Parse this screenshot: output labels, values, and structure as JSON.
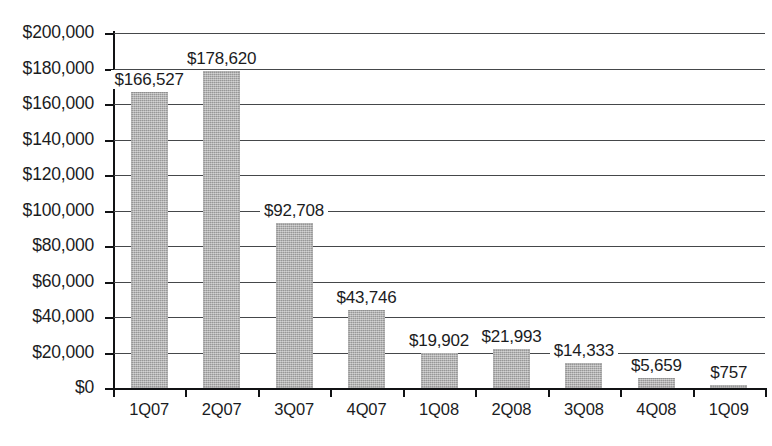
{
  "chart_data": {
    "type": "bar",
    "title": "",
    "subtitle": "",
    "xlabel": "",
    "ylabel": "",
    "categories": [
      "1Q07",
      "2Q07",
      "3Q07",
      "4Q07",
      "1Q08",
      "2Q08",
      "3Q08",
      "4Q08",
      "1Q09"
    ],
    "values": [
      166527,
      178620,
      92708,
      43746,
      19902,
      21993,
      14333,
      5659,
      757
    ],
    "value_labels": [
      "$166,527",
      "$178,620",
      "$92,708",
      "$43,746",
      "$19,902",
      "$21,993",
      "$14,333",
      "$5,659",
      "$757"
    ],
    "ylim": [
      0,
      200000
    ],
    "ytick_step": 20000,
    "ytick_values": [
      0,
      20000,
      40000,
      60000,
      80000,
      100000,
      120000,
      140000,
      160000,
      180000,
      200000
    ],
    "ytick_labels": [
      "$200,000",
      "$180,000",
      "$160,000",
      "$140,000",
      "$120,000",
      "$100,000",
      "$80,000",
      "$60,000",
      "$40,000",
      "$20,000",
      "$0"
    ],
    "grid": true,
    "grid_orientation": "horizontal",
    "legend": false,
    "legend_position": "none",
    "series": [
      {
        "name": "",
        "values": [
          166527,
          178620,
          92708,
          43746,
          19902,
          21993,
          14333,
          5659,
          757
        ]
      }
    ],
    "colors": {
      "bar_fill": "#a9a9a9",
      "gridline": "#45474a",
      "axis": "#111214",
      "text": "#1b1c1e",
      "background": "#ffffff"
    }
  }
}
